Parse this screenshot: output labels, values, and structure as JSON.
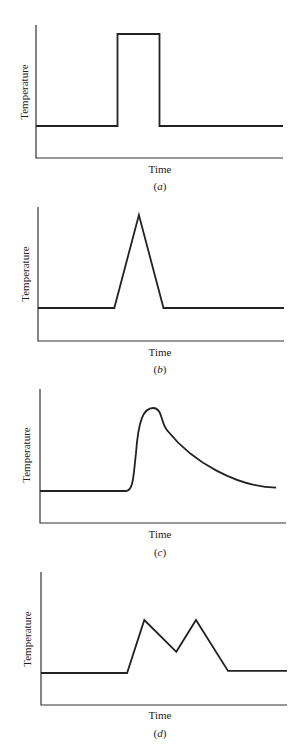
{
  "chart_data": [
    {
      "type": "line",
      "caption": "(a)",
      "caption_letter": "a",
      "xlabel": "Time",
      "ylabel": "Temperature",
      "description": "Square pulse: flat baseline, instantaneous rise to high plateau, instantaneous drop back to baseline",
      "points": [
        [
          0,
          0
        ],
        [
          0.33,
          0
        ],
        [
          0.33,
          1
        ],
        [
          0.5,
          1
        ],
        [
          0.5,
          0
        ],
        [
          1,
          0
        ]
      ],
      "grid": false,
      "ticks": false
    },
    {
      "type": "line",
      "caption": "(b)",
      "caption_letter": "b",
      "xlabel": "Time",
      "ylabel": "Temperature",
      "description": "Triangular pulse: linear rise to a single sharp peak then linear fall to baseline",
      "points": [
        [
          0,
          0
        ],
        [
          0.31,
          0
        ],
        [
          0.41,
          1
        ],
        [
          0.51,
          0
        ],
        [
          1,
          0
        ]
      ],
      "grid": false,
      "ticks": false
    },
    {
      "type": "line",
      "caption": "(c)",
      "caption_letter": "c",
      "xlabel": "Time",
      "ylabel": "Temperature",
      "description": "Rapid rise to rounded peak followed by gradual exponential-like decay toward baseline",
      "points": [
        [
          0,
          0
        ],
        [
          0.35,
          0
        ],
        [
          0.39,
          0.3
        ],
        [
          0.41,
          0.75
        ],
        [
          0.46,
          1
        ],
        [
          0.5,
          0.85
        ],
        [
          0.6,
          0.5
        ],
        [
          0.8,
          0.15
        ],
        [
          0.96,
          0.04
        ]
      ],
      "grid": false,
      "ticks": false
    },
    {
      "type": "line",
      "caption": "(d)",
      "caption_letter": "d",
      "xlabel": "Time",
      "ylabel": "Temperature",
      "description": "Double peak: rise to first peak, dip to a valley, rise to second equal peak, fall to baseline",
      "points": [
        [
          0,
          0
        ],
        [
          0.35,
          0
        ],
        [
          0.42,
          1
        ],
        [
          0.55,
          0.4
        ],
        [
          0.63,
          1
        ],
        [
          0.76,
          0.04
        ],
        [
          1,
          0.04
        ]
      ],
      "grid": false,
      "ticks": false
    }
  ],
  "style": {
    "line_color": "#222222",
    "axis_color": "#333333"
  }
}
